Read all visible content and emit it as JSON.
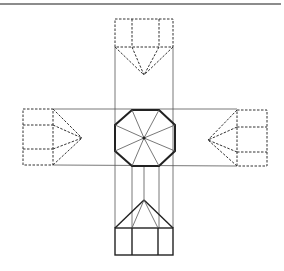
{
  "diagram": {
    "title": "",
    "colors": {
      "background": "#ffffff",
      "line": "#222222",
      "projection_line": "#555555",
      "top_rule": "#666666"
    },
    "views": [
      {
        "name": "plan-view",
        "shape": "octagon",
        "center": [
          144,
          138
        ],
        "lines": "solid-thick"
      },
      {
        "name": "top-elevation",
        "shape": "house-with-apex",
        "rect": [
          115,
          19,
          173,
          47
        ],
        "apex": [
          144,
          75
        ],
        "lines": "dashed"
      },
      {
        "name": "bottom-elevation",
        "shape": "house-with-apex",
        "rect": [
          115,
          228,
          173,
          255
        ],
        "apex": [
          144,
          200
        ],
        "lines": "solid"
      },
      {
        "name": "left-elevation",
        "shape": "house-with-apex",
        "rect": [
          23,
          109,
          53,
          165
        ],
        "apex": [
          82,
          138
        ],
        "lines": "dashed"
      },
      {
        "name": "right-elevation",
        "shape": "house-with-apex",
        "rect": [
          237,
          110,
          267,
          166
        ],
        "apex": [
          208,
          140
        ],
        "lines": "dashed"
      }
    ]
  }
}
